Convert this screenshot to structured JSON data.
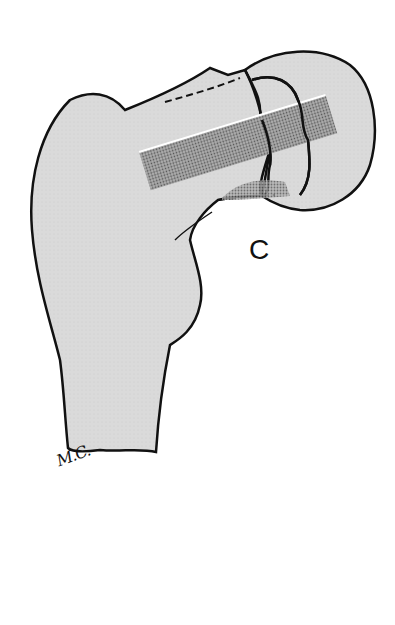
{
  "figure": {
    "panel_label": "C",
    "signature": "M.C.",
    "colors": {
      "bone_fill": "#d9d9d9",
      "outline": "#111111",
      "graft_bar": "#8a8a8a",
      "background": "#ffffff"
    }
  }
}
